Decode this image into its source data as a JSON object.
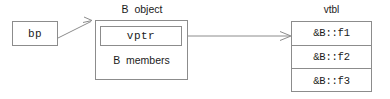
{
  "diagram": {
    "stroke_color": "#8c8c8c",
    "text_color": "#1a1a1a",
    "background": "#ffffff"
  },
  "pointer": {
    "label": "bp"
  },
  "object": {
    "caption": "B  object",
    "vptr_label": "vptr",
    "members_label": "B  members"
  },
  "vtable": {
    "caption": "vtbl",
    "entries": [
      {
        "label": "&B::f1"
      },
      {
        "label": "&B::f2"
      },
      {
        "label": "&B::f3"
      }
    ]
  },
  "connectors": [
    {
      "name": "bp-to-object",
      "from": "bp-box",
      "to": "b-object-box"
    },
    {
      "name": "vptr-to-vtbl",
      "from": "vptr-box",
      "to": "vtbl-row-0"
    }
  ]
}
